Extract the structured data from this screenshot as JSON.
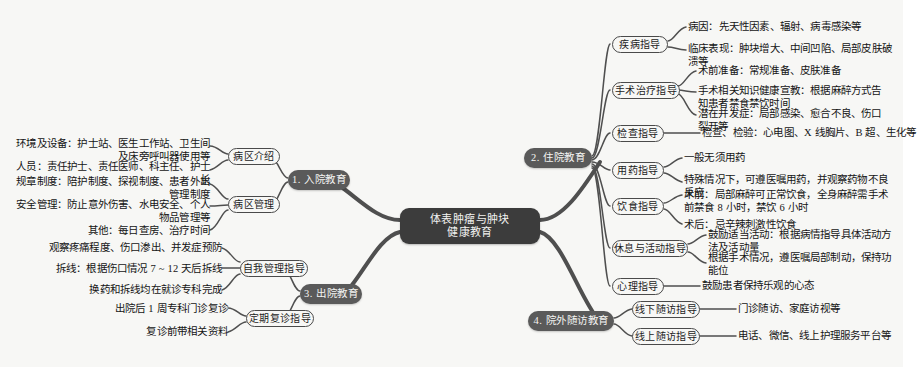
{
  "diagram": {
    "type": "mind-map",
    "colors": {
      "background": "#f7f7f5",
      "root_fill": "#3c3c3c",
      "root_text": "#f2f2f0",
      "level1_fill": "#5a5a5a",
      "level1_text": "#f4f4f2",
      "level2_border": "#4a4a4a",
      "level2_text": "#1c1c1c",
      "leaf_text": "#141414",
      "wire": "#4f4f4f"
    }
  },
  "root": {
    "line1": "体表肿瘤与肿块",
    "line2": "健康教育"
  },
  "branches": [
    {
      "id": "admission",
      "label": "1. 入院教育",
      "side": "left",
      "groups": [
        {
          "label": "病区介绍",
          "items": [
            "环境及设备：护士站、医生工作站、卫生间\n及床旁呼叫器使用等",
            "人员：责任护士、责任医师、科主任、护士\n长"
          ]
        },
        {
          "label": "病区管理",
          "items": [
            "规章制度：陪护制度、探视制度、患者外出\n管理制度",
            "安全管理：防止意外伤害、水电安全、个人\n物品管理等",
            "其他：每日查房、治疗时间"
          ]
        }
      ]
    },
    {
      "id": "inpatient",
      "label": "2. 住院教育",
      "side": "right",
      "groups": [
        {
          "label": "疾病指导",
          "items": [
            "病因：先天性因素、辐射、病毒感染等",
            "临床表现：肿块增大、中间凹陷、局部皮肤破\n溃等"
          ]
        },
        {
          "label": "手术治疗指导",
          "items": [
            "术前准备：常规准备、皮肤准备",
            "手术相关知识健康宣教：根据麻醉方式告\n知患者禁食禁饮时间",
            "潜在并发症：局部感染、愈合不良、伤口\n裂开等"
          ]
        },
        {
          "label": "检查指导",
          "items": [
            "检查、检验：心电图、X 线胸片、B 超、生化等"
          ]
        },
        {
          "label": "用药指导",
          "items": [
            "一般无须用药",
            "特殊情况下，可遵医嘱用药，并观察药物不良\n反应"
          ]
        },
        {
          "label": "饮食指导",
          "items": [
            "术前：局部麻醉可正常饮食，全身麻醉需手术\n前禁食 8 小时，禁饮 6 小时",
            "术后：忌辛辣刺激性饮食"
          ]
        },
        {
          "label": "休息与活动指导",
          "items": [
            "鼓励适当活动：根据病情指导具体活动方\n法及活动量",
            "根据手术情况，遵医嘱局部制动，保持功\n能位"
          ]
        },
        {
          "label": "心理指导",
          "items": [
            "鼓励患者保持乐观的心态"
          ]
        }
      ]
    },
    {
      "id": "discharge",
      "label": "3. 出院教育",
      "side": "left",
      "groups": [
        {
          "label": "自我管理指导",
          "items": [
            "观察疼痛程度、伤口渗出、并发症预防",
            "拆线：根据伤口情况 7 ~ 12 天后拆线",
            "换药和拆线均在就诊专科完成"
          ]
        },
        {
          "label": "定期复诊指导",
          "items": [
            "出院后 1 周专科门诊复诊",
            "复诊前带相关资料"
          ]
        }
      ]
    },
    {
      "id": "followup",
      "label": "4. 院外随访教育",
      "side": "right",
      "groups": [
        {
          "label": "线下随访指导",
          "items": [
            "门诊随访、家庭访视等"
          ]
        },
        {
          "label": "线上随访指导",
          "items": [
            "电话、微信、线上护理服务平台等"
          ]
        }
      ]
    }
  ]
}
